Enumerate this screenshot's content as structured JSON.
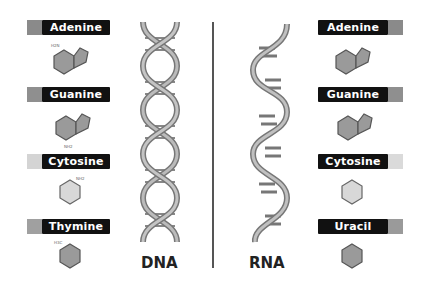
{
  "dna": {
    "title": "DNA",
    "bases": [
      {
        "name": "Adenine",
        "swatch_color": "#8a8a8a"
      },
      {
        "name": "Guanine",
        "swatch_color": "#8f8f8f"
      },
      {
        "name": "Cytosine",
        "swatch_color": "#d4d4d4"
      },
      {
        "name": "Thymine",
        "swatch_color": "#a0a0a0"
      }
    ]
  },
  "rna": {
    "title": "RNA",
    "bases": [
      {
        "name": "Adenine",
        "swatch_color": "#8a8a8a"
      },
      {
        "name": "Guanine",
        "swatch_color": "#8f8f8f"
      },
      {
        "name": "Cytosine",
        "swatch_color": "#dadada"
      },
      {
        "name": "Uracil",
        "swatch_color": "#9a9a9a"
      }
    ]
  }
}
